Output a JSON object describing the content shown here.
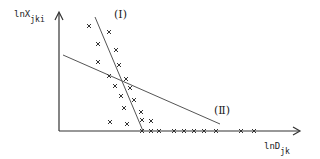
{
  "chart_data": {
    "type": "scatter",
    "title": "",
    "ylabel": {
      "main": "lnX",
      "sub": "jki"
    },
    "xlabel": {
      "main": "lnD",
      "sub": "jk"
    },
    "line_labels": [
      "(Ⅰ)",
      "(Ⅱ)"
    ],
    "axis_color": "#333333",
    "line_color": "#555555",
    "marker": "x",
    "points": [
      [
        89,
        26
      ],
      [
        109,
        32
      ],
      [
        98,
        44
      ],
      [
        116,
        50
      ],
      [
        98,
        62
      ],
      [
        119,
        65
      ],
      [
        109,
        76
      ],
      [
        126,
        79
      ],
      [
        115,
        86
      ],
      [
        130,
        88
      ],
      [
        121,
        96
      ],
      [
        134,
        100
      ],
      [
        124,
        108
      ],
      [
        141,
        112
      ],
      [
        110,
        122
      ],
      [
        127,
        124
      ],
      [
        142,
        120
      ],
      [
        151,
        121
      ],
      [
        142,
        131
      ],
      [
        151,
        131
      ],
      [
        159,
        131
      ],
      [
        174,
        131
      ],
      [
        184,
        131
      ],
      [
        194,
        131
      ],
      [
        204,
        131
      ],
      [
        216,
        131
      ],
      [
        241,
        131
      ],
      [
        254,
        131
      ]
    ],
    "lines": [
      {
        "id": "I",
        "from": [
          95,
          17
        ],
        "to": [
          143,
          131
        ]
      },
      {
        "id": "II",
        "from": [
          63,
          55
        ],
        "to": [
          220,
          124
        ]
      }
    ]
  }
}
